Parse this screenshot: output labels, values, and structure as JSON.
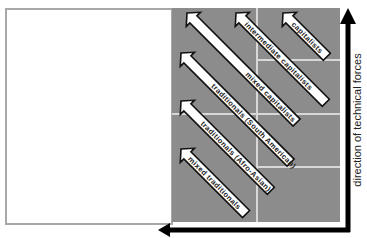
{
  "diagram": {
    "axis_label_vertical": "direction of technical forces",
    "arrows": [
      {
        "label": "capitalists"
      },
      {
        "label": "intermediate capitalists"
      },
      {
        "label": "mixed capitalists"
      },
      {
        "label": "traditionals (South American)"
      },
      {
        "label": "traditionals (Afro-Asian)"
      },
      {
        "label": "mixed traditionals"
      }
    ],
    "colors": {
      "panel": "#8c8c8c",
      "grid": "#d8d8d8",
      "arrow_fill": "#ffffff",
      "arrow_stroke": "#111111",
      "axis": "#000000"
    }
  }
}
